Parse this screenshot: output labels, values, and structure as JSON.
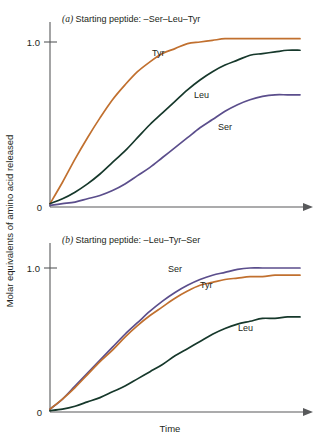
{
  "figure": {
    "y_axis_label": "Molar equivalents of amino acid released",
    "x_axis_label": "Time"
  },
  "colors": {
    "tyr": "#C1702F",
    "leu": "#16382B",
    "ser": "#5B4E8C",
    "axis": "#58595b",
    "text": "#231f20",
    "background": "#ffffff"
  },
  "panels": [
    {
      "id": "panel-a",
      "letter": "(a)",
      "title": " Starting peptide: –Ser–Leu–Tyr",
      "full_title": "(a) Starting peptide: –Ser–Leu–Tyr",
      "y_ticks": [
        "1.0",
        "0"
      ],
      "labels": [
        {
          "text": "Tyr",
          "x": 152,
          "y": 52
        },
        {
          "text": "Leu",
          "x": 194,
          "y": 94
        },
        {
          "text": "Ser",
          "x": 218,
          "y": 126
        }
      ]
    },
    {
      "id": "panel-b",
      "letter": "(b)",
      "title": " Starting peptide: –Leu–Tyr–Ser",
      "full_title": "(b) Starting peptide: –Leu–Tyr–Ser",
      "y_ticks": [
        "1.0",
        "0"
      ],
      "labels": [
        {
          "text": "Ser",
          "x": 168,
          "y": 268
        },
        {
          "text": "Tyr",
          "x": 200,
          "y": 284
        },
        {
          "text": "Leu",
          "x": 238,
          "y": 327
        }
      ]
    }
  ],
  "chart_data": {
    "type": "line",
    "xlabel": "Time",
    "ylabel": "Molar equivalents of amino acid released",
    "xlim": [
      0,
      10
    ],
    "ylim": [
      0,
      1.15
    ],
    "ytick_values": [
      0,
      1.0
    ],
    "ytick_labels": [
      "0",
      "1.0"
    ],
    "xticks": [],
    "grid": false,
    "legend": "inline-curve-labels",
    "panels": [
      {
        "panel": "a",
        "title": "(a) Starting peptide: –Ser–Leu–Tyr",
        "x": [
          0,
          0.5,
          1,
          1.5,
          2,
          2.5,
          3,
          3.5,
          4,
          4.5,
          5,
          5.5,
          6,
          6.5,
          7,
          7.5,
          8,
          8.5,
          9,
          9.5,
          10
        ],
        "series": [
          {
            "name": "Tyr",
            "color": "#C1702F",
            "values": [
              0.02,
              0.15,
              0.29,
              0.42,
              0.54,
              0.65,
              0.74,
              0.82,
              0.88,
              0.93,
              0.96,
              0.99,
              1.0,
              1.01,
              1.02,
              1.02,
              1.02,
              1.02,
              1.02,
              1.02,
              1.02
            ]
          },
          {
            "name": "Leu",
            "color": "#16382B",
            "values": [
              0.02,
              0.05,
              0.09,
              0.14,
              0.2,
              0.27,
              0.34,
              0.42,
              0.5,
              0.57,
              0.64,
              0.71,
              0.77,
              0.82,
              0.86,
              0.89,
              0.92,
              0.93,
              0.94,
              0.95,
              0.95
            ]
          },
          {
            "name": "Ser",
            "color": "#5B4E8C",
            "values": [
              0.01,
              0.02,
              0.03,
              0.05,
              0.07,
              0.1,
              0.14,
              0.19,
              0.24,
              0.3,
              0.36,
              0.42,
              0.48,
              0.53,
              0.58,
              0.62,
              0.65,
              0.67,
              0.68,
              0.68,
              0.68
            ]
          }
        ]
      },
      {
        "panel": "b",
        "title": "(b) Starting peptide: –Leu–Tyr–Ser",
        "x": [
          0,
          0.5,
          1,
          1.5,
          2,
          2.5,
          3,
          3.5,
          4,
          4.5,
          5,
          5.5,
          6,
          6.5,
          7,
          7.5,
          8,
          8.5,
          9,
          9.5,
          10
        ],
        "series": [
          {
            "name": "Ser",
            "color": "#5B4E8C",
            "values": [
              0.02,
              0.09,
              0.18,
              0.27,
              0.36,
              0.45,
              0.54,
              0.62,
              0.7,
              0.77,
              0.83,
              0.88,
              0.92,
              0.95,
              0.97,
              0.99,
              1.0,
              1.0,
              1.0,
              1.0,
              1.0
            ]
          },
          {
            "name": "Tyr",
            "color": "#C1702F",
            "values": [
              0.02,
              0.09,
              0.17,
              0.26,
              0.35,
              0.43,
              0.52,
              0.6,
              0.67,
              0.73,
              0.79,
              0.84,
              0.88,
              0.9,
              0.92,
              0.93,
              0.94,
              0.94,
              0.95,
              0.95,
              0.95
            ]
          },
          {
            "name": "Leu",
            "color": "#16382B",
            "values": [
              0.01,
              0.02,
              0.04,
              0.07,
              0.1,
              0.14,
              0.18,
              0.23,
              0.28,
              0.33,
              0.39,
              0.44,
              0.49,
              0.54,
              0.58,
              0.61,
              0.63,
              0.65,
              0.65,
              0.66,
              0.66
            ]
          }
        ]
      }
    ]
  }
}
